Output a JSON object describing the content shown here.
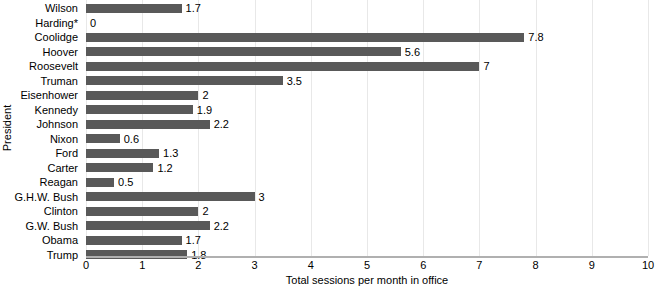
{
  "chart_data": {
    "type": "bar",
    "orientation": "horizontal",
    "title": "",
    "xlabel": "Total sessions per month in office",
    "ylabel": "President",
    "xlim": [
      0,
      10
    ],
    "xticks": [
      0,
      1,
      2,
      3,
      4,
      5,
      6,
      7,
      8,
      9,
      10
    ],
    "xtick_labels": [
      "0",
      "1",
      "2",
      "3",
      "4",
      "5",
      "6",
      "7",
      "8",
      "9",
      "10"
    ],
    "grid": true,
    "legend": "none",
    "bar_color": "#595959",
    "categories": [
      "Wilson",
      "Harding*",
      "Coolidge",
      "Hoover",
      "Roosevelt",
      "Truman",
      "Eisenhower",
      "Kennedy",
      "Johnson",
      "Nixon",
      "Ford",
      "Carter",
      "Reagan",
      "G.H.W. Bush",
      "Clinton",
      "G.W. Bush",
      "Obama",
      "Trump"
    ],
    "values": [
      1.7,
      0,
      7.8,
      5.6,
      7,
      3.5,
      2,
      1.9,
      2.2,
      0.6,
      1.3,
      1.2,
      0.5,
      3,
      2,
      2.2,
      1.7,
      1.8
    ],
    "value_labels": [
      "1.7",
      "0",
      "7.8",
      "5.6",
      "7",
      "3.5",
      "2",
      "1.9",
      "2.2",
      "0.6",
      "1.3",
      "1.2",
      "0.5",
      "3",
      "2",
      "2.2",
      "1.7",
      "1.8"
    ]
  }
}
